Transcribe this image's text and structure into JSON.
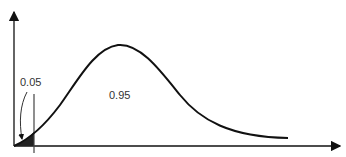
{
  "diagram": {
    "type": "right-skewed probability density curve with shaded left tail",
    "colors": {
      "curve": "#111111",
      "axis": "#111111",
      "shaded_tail": "#222222",
      "text": "#333333",
      "background": "#ffffff"
    },
    "labels": {
      "tail_area": "0.05",
      "body_area": "0.95"
    }
  }
}
